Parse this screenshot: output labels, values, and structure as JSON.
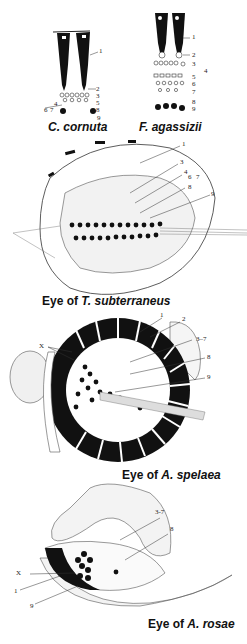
{
  "figure": {
    "panels": [
      {
        "id": "c-cornuta",
        "caption_prefix": "",
        "species": "C. cornuta",
        "labels": [
          "1",
          "2",
          "3",
          "4",
          "5",
          "6",
          "7",
          "8",
          "9"
        ]
      },
      {
        "id": "f-agassizii",
        "caption_prefix": "",
        "species": "F. agassizii",
        "labels": [
          "1",
          "2",
          "3",
          "4",
          "5",
          "6",
          "7",
          "8",
          "9"
        ]
      },
      {
        "id": "t-subterraneus",
        "caption_prefix": "Eye of ",
        "species": "T. subterraneus",
        "labels": [
          "1",
          "3",
          "4",
          "6",
          "7",
          "8",
          "9"
        ]
      },
      {
        "id": "a-spelaea",
        "caption_prefix": "Eye of ",
        "species": "A. spelaea",
        "labels": [
          "1",
          "2",
          "3–7",
          "8",
          "9",
          "X"
        ]
      },
      {
        "id": "a-rosae",
        "caption_prefix": "Eye of ",
        "species": "A. rosae",
        "labels": [
          "3-7",
          "8",
          "X",
          "1",
          "9"
        ]
      }
    ]
  },
  "colors": {
    "ink": "#111111",
    "stipple": "#bbbbbb",
    "background": "#ffffff"
  }
}
